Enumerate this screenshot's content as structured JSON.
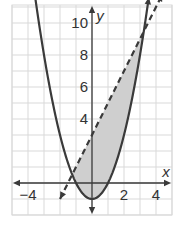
{
  "chart_data": {
    "type": "line",
    "title": "",
    "xlabel": "x",
    "ylabel": "y",
    "xlim": [
      -5,
      5
    ],
    "ylim": [
      -2,
      11
    ],
    "grid": true,
    "grid_step": 1,
    "x_tick_labels": [
      {
        "value": -4,
        "label": "−4"
      },
      {
        "value": 2,
        "label": "2"
      },
      {
        "value": 4,
        "label": "4"
      }
    ],
    "y_tick_labels": [
      {
        "value": 4,
        "label": "4"
      },
      {
        "value": 6,
        "label": "6"
      },
      {
        "value": 8,
        "label": "8"
      },
      {
        "value": 10,
        "label": "10"
      }
    ],
    "series": [
      {
        "name": "parabola",
        "equation": "y = x^2 - 1",
        "style": "solid",
        "vertex": [
          0,
          -1
        ]
      },
      {
        "name": "line",
        "equation": "y = 2x + 3",
        "style": "dashed",
        "y_intercept": 3,
        "slope": 2
      }
    ],
    "shaded_region": {
      "description": "between y = x^2 - 1 (below) and y = 2x + 3 (above)",
      "x_range": [
        -1.24,
        3.24
      ],
      "color": "#cfcfcf"
    },
    "colors": {
      "curve": "#3a3a3a",
      "grid": "#d9d9d9",
      "axis": "#3a3a3a",
      "shade": "#cfcfcf"
    }
  }
}
